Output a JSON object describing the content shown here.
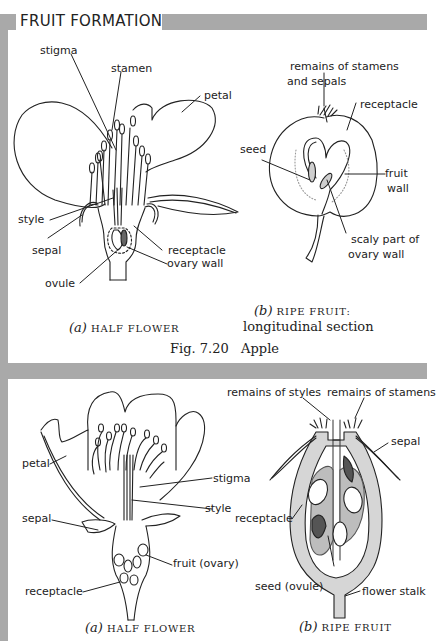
{
  "page": {
    "title": "FRUIT FORMATION",
    "colors": {
      "band": "#a9a9a9",
      "ink": "#222222",
      "shade": "#cfcfcf"
    }
  },
  "figure_apple": {
    "panel_a": {
      "labels": {
        "stigma": "stigma",
        "stamen": "stamen",
        "petal": "petal",
        "style": "style",
        "sepal": "sepal",
        "receptacle": "receptacle",
        "ovary_wall": "ovary wall",
        "ovule": "ovule"
      },
      "caption_letter": "(a)",
      "caption_text": "HALF FLOWER"
    },
    "panel_b": {
      "labels": {
        "remains_line1": "remains of stamens",
        "remains_line2": "and sepals",
        "receptacle": "receptacle",
        "seed": "seed",
        "fruit_wall_line1": "fruit",
        "fruit_wall_line2": "wall",
        "scaly_line1": "scaly part of",
        "scaly_line2": "ovary wall"
      },
      "caption_letter": "(b)",
      "caption_text": "RIPE FRUIT:",
      "caption_sub": "longitudinal section"
    },
    "fig_caption": "Fig. 7.20   Apple"
  },
  "figure_second": {
    "panel_a": {
      "labels": {
        "petal": "petal",
        "stigma": "stigma",
        "style": "style",
        "sepal": "sepal",
        "fruit_ovary": "fruit (ovary)",
        "receptacle": "receptacle"
      },
      "caption_letter": "(a)",
      "caption_text": "HALF FLOWER"
    },
    "panel_b": {
      "labels": {
        "remains_styles": "remains of styles",
        "remains_stamens": "remains of stamens",
        "sepal": "sepal",
        "receptacle": "receptacle",
        "seed_ovule": "seed (ovule)",
        "flower_stalk": "flower stalk"
      },
      "caption_letter": "(b)",
      "caption_text": "RIPE FRUIT"
    }
  }
}
